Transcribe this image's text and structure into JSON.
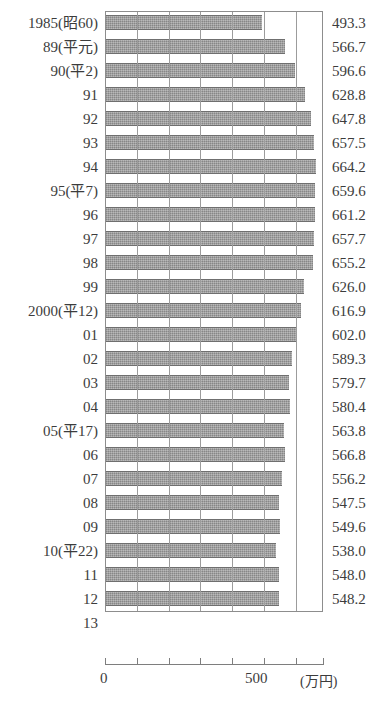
{
  "chart_data": {
    "type": "bar",
    "orientation": "horizontal",
    "title": "",
    "xlabel": "(万円)",
    "ylabel": "",
    "xlim": [
      0,
      685
    ],
    "xticks": [
      0,
      100,
      200,
      300,
      400,
      500,
      600
    ],
    "xtick_labels": [
      "0",
      "",
      "",
      "",
      "",
      "500",
      ""
    ],
    "grid": true,
    "grid_axis": "x",
    "legend": false,
    "bar_color": "#9a9a9a",
    "categories": [
      "1985(昭60)",
      "89(平元)",
      "90(平2)",
      "91",
      "92",
      "93",
      "94",
      "95(平7)",
      "96",
      "97",
      "98",
      "99",
      "2000(平12)",
      "01",
      "02",
      "03",
      "04",
      "05(平17)",
      "06",
      "07",
      "08",
      "09",
      "10(平22)",
      "11",
      "12",
      "13"
    ],
    "values": [
      493.3,
      566.7,
      596.6,
      628.8,
      647.8,
      657.5,
      664.2,
      659.6,
      661.2,
      657.7,
      655.2,
      626.0,
      616.9,
      602.0,
      589.3,
      579.7,
      580.4,
      563.8,
      566.8,
      556.2,
      547.5,
      549.6,
      538.0,
      548.0,
      548.2,
      null
    ],
    "value_labels": [
      "493.3",
      "566.7",
      "596.6",
      "628.8",
      "647.8",
      "657.5",
      "664.2",
      "659.6",
      "661.2",
      "657.7",
      "655.2",
      "626.0",
      "616.9",
      "602.0",
      "589.3",
      "579.7",
      "580.4",
      "563.8",
      "566.8",
      "556.2",
      "547.5",
      "549.6",
      "538.0",
      "548.0",
      "548.2",
      ""
    ]
  },
  "axis": {
    "zero_label": "0",
    "mid_label": "500",
    "unit_label": "(万円)"
  }
}
